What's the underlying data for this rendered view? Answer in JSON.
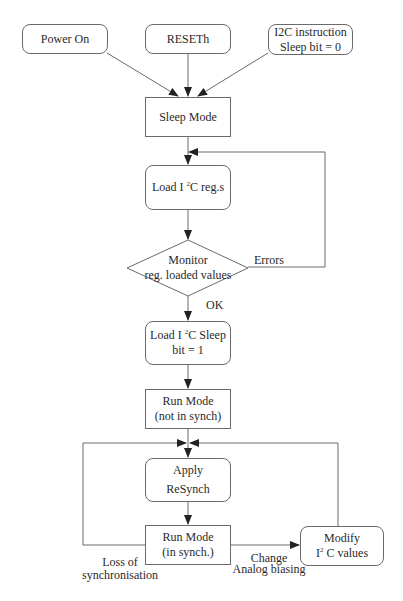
{
  "diagram": {
    "type": "flowchart",
    "nodes": {
      "power_on": {
        "label": "Power On"
      },
      "reseth": {
        "label": "RESETh"
      },
      "i2c_instruction": {
        "line1": "I2C instruction",
        "line2": "Sleep bit = 0"
      },
      "sleep_mode": {
        "label": "Sleep Mode"
      },
      "load_i2c_regs": {
        "pre": "Load I ",
        "sup": "2",
        "post": "C reg.s"
      },
      "monitor": {
        "line1": "Monitor",
        "line2": "reg. loaded values"
      },
      "load_i2c_sleep": {
        "pre": "Load I ",
        "sup": "2",
        "post": "C Sleep",
        "line2": "bit = 1"
      },
      "run_mode_not_synch": {
        "line1": "Run Mode",
        "line2": "(not in synch)"
      },
      "apply_resynch": {
        "line1": "Apply",
        "line2": "ReSynch"
      },
      "run_mode_synch": {
        "line1": "Run Mode",
        "line2": "(in synch.)"
      },
      "modify_i2c": {
        "line1": "Modify",
        "pre": "I",
        "sup": "2",
        "post": " C values"
      }
    },
    "edge_labels": {
      "errors": "Errors",
      "ok": "OK",
      "loss_line1": "Loss of",
      "loss_line2": "synchronisation",
      "change_line1": "Change",
      "change_line2": "Analog biasing"
    },
    "edges": [
      {
        "from": "power_on",
        "to": "sleep_mode"
      },
      {
        "from": "reseth",
        "to": "sleep_mode"
      },
      {
        "from": "i2c_instruction",
        "to": "sleep_mode"
      },
      {
        "from": "sleep_mode",
        "to": "load_i2c_regs"
      },
      {
        "from": "load_i2c_regs",
        "to": "monitor"
      },
      {
        "from": "monitor",
        "to": "load_i2c_regs",
        "label": "Errors"
      },
      {
        "from": "monitor",
        "to": "load_i2c_sleep",
        "label": "OK"
      },
      {
        "from": "load_i2c_sleep",
        "to": "run_mode_not_synch"
      },
      {
        "from": "run_mode_not_synch",
        "to": "apply_resynch"
      },
      {
        "from": "apply_resynch",
        "to": "run_mode_synch"
      },
      {
        "from": "run_mode_synch",
        "to": "apply_resynch",
        "label": "Loss of synchronisation"
      },
      {
        "from": "run_mode_synch",
        "to": "modify_i2c",
        "label": "Change Analog biasing"
      },
      {
        "from": "modify_i2c",
        "to": "apply_resynch"
      }
    ]
  },
  "colors": {
    "line": "#6a6a6a",
    "text": "#2a2a2a",
    "background": "#ffffff"
  }
}
